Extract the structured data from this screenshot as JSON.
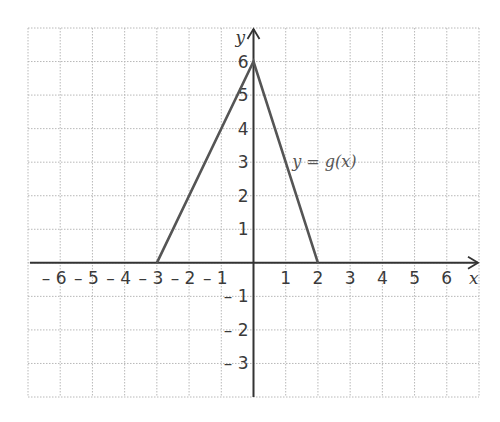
{
  "chart_data": {
    "type": "line",
    "title": "",
    "xlabel": "x",
    "ylabel": "y",
    "xlim": [
      -7,
      7
    ],
    "ylim": [
      -4,
      7
    ],
    "grid": true,
    "x_ticks": [
      -6,
      -5,
      -4,
      -3,
      -2,
      -1,
      1,
      2,
      3,
      4,
      5,
      6
    ],
    "y_ticks": [
      -3,
      -2,
      -1,
      1,
      2,
      3,
      4,
      5,
      6
    ],
    "series": [
      {
        "name": "y = g(x)",
        "x": [
          -3,
          0,
          2
        ],
        "y": [
          0,
          6,
          0
        ],
        "color": "#555555"
      }
    ],
    "annotations": [
      {
        "text": "y = g(x)",
        "x": 1.2,
        "y": 3
      }
    ]
  },
  "colors": {
    "grid": "#b8b8b8",
    "axis": "#333333",
    "curve": "#555555",
    "text": "#3a3a3a"
  }
}
